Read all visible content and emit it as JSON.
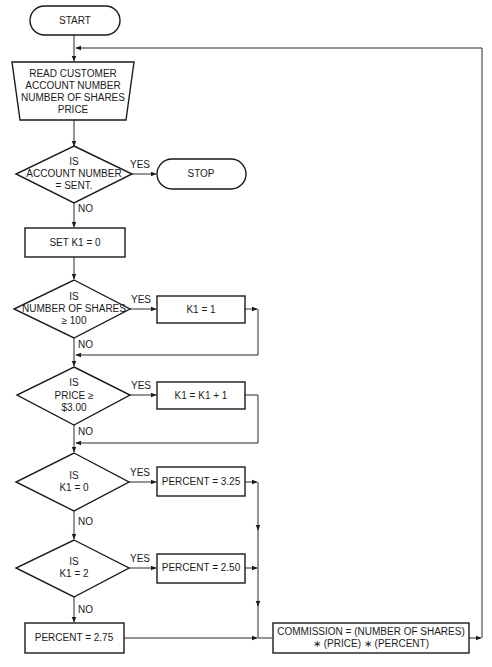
{
  "diagram": {
    "type": "flowchart",
    "title": "",
    "nodes": [
      {
        "id": "start",
        "shape": "terminal",
        "lines": [
          "START"
        ]
      },
      {
        "id": "read",
        "shape": "input-trapezoid",
        "lines": [
          "READ CUSTOMER",
          "ACCOUNT NUMBER",
          "NUMBER OF SHARES",
          "PRICE"
        ]
      },
      {
        "id": "dec_account",
        "shape": "decision",
        "lines": [
          "IS",
          "ACCOUNT NUMBER",
          "= SENT."
        ]
      },
      {
        "id": "stop",
        "shape": "terminal",
        "lines": [
          "STOP"
        ]
      },
      {
        "id": "set_k1",
        "shape": "process",
        "lines": [
          "SET K1 = 0"
        ]
      },
      {
        "id": "dec_shares",
        "shape": "decision",
        "lines": [
          "IS",
          "NUMBER OF SHARES",
          "≥ 100"
        ]
      },
      {
        "id": "k1_eq_1",
        "shape": "process",
        "lines": [
          "K1 = 1"
        ]
      },
      {
        "id": "dec_price",
        "shape": "decision",
        "lines": [
          "IS",
          "PRICE ≥",
          "$3.00"
        ]
      },
      {
        "id": "k1_inc",
        "shape": "process",
        "lines": [
          "K1 = K1 + 1"
        ]
      },
      {
        "id": "dec_k1_0",
        "shape": "decision",
        "lines": [
          "IS",
          "K1 = 0"
        ]
      },
      {
        "id": "pct_325",
        "shape": "process",
        "lines": [
          "PERCENT = 3.25"
        ]
      },
      {
        "id": "dec_k1_2",
        "shape": "decision",
        "lines": [
          "IS",
          "K1 = 2"
        ]
      },
      {
        "id": "pct_250",
        "shape": "process",
        "lines": [
          "PERCENT = 2.50"
        ]
      },
      {
        "id": "pct_275",
        "shape": "process",
        "lines": [
          "PERCENT = 2.75"
        ]
      },
      {
        "id": "commission",
        "shape": "process",
        "lines": [
          "COMMISSION = (NUMBER OF SHARES)",
          "∗ (PRICE) ∗ (PERCENT)"
        ]
      }
    ],
    "edges": [
      {
        "from": "start",
        "to": "read",
        "label": ""
      },
      {
        "from": "read",
        "to": "dec_account",
        "label": ""
      },
      {
        "from": "dec_account",
        "to": "stop",
        "label": "YES"
      },
      {
        "from": "dec_account",
        "to": "set_k1",
        "label": "NO"
      },
      {
        "from": "set_k1",
        "to": "dec_shares",
        "label": ""
      },
      {
        "from": "dec_shares",
        "to": "k1_eq_1",
        "label": "YES"
      },
      {
        "from": "dec_shares",
        "to": "dec_price",
        "label": "NO"
      },
      {
        "from": "k1_eq_1",
        "to": "dec_price",
        "label": ""
      },
      {
        "from": "dec_price",
        "to": "k1_inc",
        "label": "YES"
      },
      {
        "from": "dec_price",
        "to": "dec_k1_0",
        "label": "NO"
      },
      {
        "from": "k1_inc",
        "to": "dec_k1_0",
        "label": ""
      },
      {
        "from": "dec_k1_0",
        "to": "pct_325",
        "label": "YES"
      },
      {
        "from": "dec_k1_0",
        "to": "dec_k1_2",
        "label": "NO"
      },
      {
        "from": "dec_k1_2",
        "to": "pct_250",
        "label": "YES"
      },
      {
        "from": "dec_k1_2",
        "to": "pct_275",
        "label": "NO"
      },
      {
        "from": "pct_325",
        "to": "commission",
        "label": ""
      },
      {
        "from": "pct_250",
        "to": "commission",
        "label": ""
      },
      {
        "from": "pct_275",
        "to": "commission",
        "label": ""
      },
      {
        "from": "commission",
        "to": "read",
        "label": ""
      }
    ],
    "labels": {
      "yes": "YES",
      "no": "NO"
    }
  },
  "text": {
    "start": "START",
    "read": [
      "READ CUSTOMER",
      "ACCOUNT NUMBER",
      "NUMBER OF SHARES",
      "PRICE"
    ],
    "dec_account": [
      "IS",
      "ACCOUNT NUMBER",
      "= SENT."
    ],
    "stop": "STOP",
    "set_k1": "SET K1 = 0",
    "dec_shares": [
      "IS",
      "NUMBER OF SHARES",
      "≥ 100"
    ],
    "k1_eq_1": "K1 = 1",
    "dec_price": [
      "IS",
      "PRICE ≥",
      "$3.00"
    ],
    "k1_inc": "K1 = K1 + 1",
    "dec_k1_0": [
      "IS",
      "K1 = 0"
    ],
    "pct_325": "PERCENT = 3.25",
    "dec_k1_2": [
      "IS",
      "K1 = 2"
    ],
    "pct_250": "PERCENT = 2.50",
    "pct_275": "PERCENT = 2.75",
    "commission": [
      "COMMISSION = (NUMBER OF SHARES)",
      "∗ (PRICE) ∗ (PERCENT)"
    ],
    "yes": "YES",
    "no": "NO"
  }
}
